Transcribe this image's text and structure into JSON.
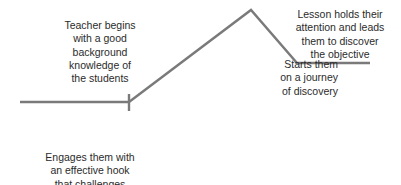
{
  "diagram": {
    "type": "lesson-arc",
    "line_color": "#7a7a7a",
    "path_points": [
      [
        20,
        102
      ],
      [
        129,
        102
      ],
      [
        251,
        10
      ],
      [
        297,
        63
      ],
      [
        370,
        63
      ]
    ],
    "tick": {
      "x": 129,
      "y1": 94,
      "y2": 111
    },
    "labels": {
      "teacher": "Teacher begins\nwith a good\nbackground\nknowledge of\nthe students",
      "hook": "Engages them with\nan effective hook\nthat challenges\nthem to get involved",
      "journey": "Starts them\non a journey\nof discovery",
      "lesson": "Lesson holds their\nattention and leads\nthem to discover\nthe  objective"
    }
  }
}
